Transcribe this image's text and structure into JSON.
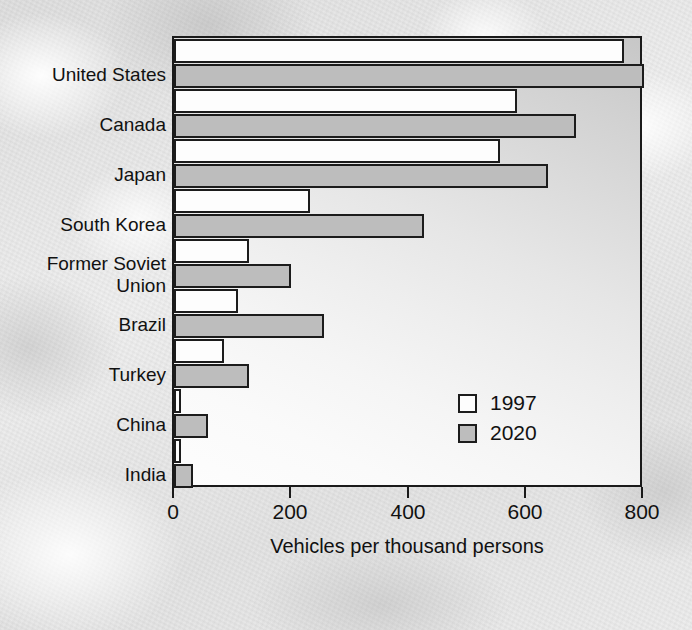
{
  "chart_data": {
    "type": "bar",
    "orientation": "horizontal",
    "title": "",
    "xlabel": "Vehicles per thousand persons",
    "ylabel": "",
    "xlim": [
      0,
      800
    ],
    "xticks": [
      0,
      200,
      400,
      600,
      800
    ],
    "xtick_labels": [
      "0",
      "200",
      "400",
      "600",
      "800"
    ],
    "grid": false,
    "legend_position": "inside-right",
    "categories": [
      "United States",
      "Canada",
      "Japan",
      "South Korea",
      "Former Soviet\nUnion",
      "Brazil",
      "Turkey",
      "China",
      "India"
    ],
    "series": [
      {
        "name": "1997",
        "color": "#fdfdfd",
        "values": [
          766,
          583,
          555,
          231,
          127,
          109,
          85,
          12,
          12
        ]
      },
      {
        "name": "2020",
        "color": "#bdbdbd",
        "values": [
          800,
          684,
          637,
          426,
          199,
          256,
          127,
          58,
          32
        ]
      }
    ],
    "legend": [
      {
        "label": "1997",
        "swatch": "white-square"
      },
      {
        "label": "2020",
        "swatch": "grey-square"
      }
    ]
  },
  "colors": {
    "bar_1997": "#fdfdfd",
    "bar_2020": "#bdbdbd",
    "bar_outline": "#1c1c1c",
    "axis": "#1a1a1a",
    "text": "#111111",
    "page_background": "#e9e9e9"
  }
}
